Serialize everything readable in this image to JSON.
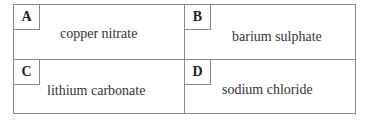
{
  "options": [
    {
      "letter": "A",
      "text": "copper nitrate"
    },
    {
      "letter": "B",
      "text": "barium sulphate"
    },
    {
      "letter": "C",
      "text": "lithium carbonate"
    },
    {
      "letter": "D",
      "text": "sodium chloride"
    }
  ]
}
